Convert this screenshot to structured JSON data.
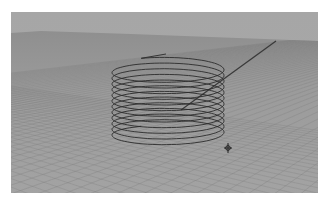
{
  "viewport": {
    "label": "Perspective viewport",
    "view_type": "perspective",
    "colors": {
      "sky": "#aaaaaa",
      "sky_top": "#a6a6a6",
      "floor_far": "#8f8f8f",
      "floor_near": "#a3a3a3",
      "grid_line": "#7d7d7d",
      "axis_line": "#3a3a3a",
      "helix_stroke": "#2b2b2b",
      "pivot": "#1e1e1e"
    },
    "horizon": {
      "points": [
        [
          0,
          21
        ],
        [
          30,
          19
        ],
        [
          120,
          22
        ],
        [
          307,
          29
        ]
      ]
    },
    "axis_line": {
      "from": [
        265,
        29
      ],
      "to": [
        170,
        98
      ]
    }
  },
  "helix": {
    "name": "helix-curve",
    "coils": 12,
    "center_x": 157,
    "top_center_y": 56,
    "bottom_center_y": 124,
    "radius_x": 56,
    "radius_y": 11,
    "start_point": [
      155,
      42
    ]
  },
  "pivot": {
    "name": "pivot-manipulator",
    "icon": "crosshair-pivot-icon",
    "x": 217,
    "y": 136
  }
}
